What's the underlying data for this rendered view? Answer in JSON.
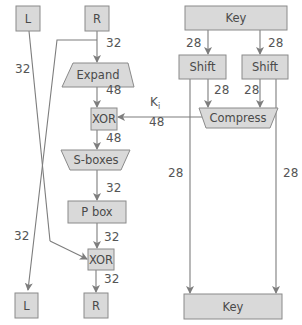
{
  "diagram": {
    "colors": {
      "box_fill": "#d9d9d9",
      "box_stroke": "#8a8a8a",
      "line": "#7d7d7d",
      "text": "#4a4a4a"
    },
    "inputs": {
      "left": "L",
      "right": "R",
      "key": "Key"
    },
    "outputs": {
      "left": "L",
      "right": "R",
      "key": "Key"
    },
    "blocks": {
      "expand": "Expand",
      "xor1": "XOR",
      "sboxes": "S-boxes",
      "pbox": "P box",
      "xor2": "XOR",
      "shift_left": "Shift",
      "shift_right": "Shift",
      "compress": "Compress"
    },
    "round_key": {
      "symbol": "K",
      "subscript": "i"
    },
    "edge_labels": {
      "r_to_expand": "32",
      "l_cross": "32",
      "expand_to_xor": "48",
      "xor_to_sboxes": "48",
      "sboxes_to_pbox": "32",
      "pbox_to_xor": "32",
      "xor_to_r": "32",
      "r_cross": "32",
      "key_to_shift_left": "28",
      "key_to_shift_right": "28",
      "shift_left_to_compress": "28",
      "shift_right_to_compress": "28",
      "compress_to_xor": "48",
      "shift_left_to_key": "28",
      "shift_right_to_key": "28"
    }
  }
}
